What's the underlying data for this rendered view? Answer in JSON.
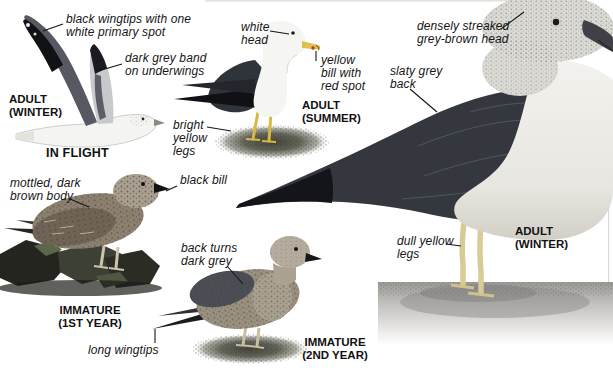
{
  "plate": {
    "subject": "gull identification plate",
    "figures": {
      "in_flight": {
        "stage": "ADULT\n(WINTER)",
        "caption": "IN FLIGHT",
        "annotations": {
          "wingtips": "black wingtips with one\nwhite primary spot",
          "underwings": "dark grey band\non underwings"
        }
      },
      "adult_summer": {
        "stage": "ADULT\n(SUMMER)",
        "annotations": {
          "head": "white\nhead",
          "bill": "yellow\nbill with\nred spot",
          "legs": "bright\nyellow\nlegs"
        }
      },
      "adult_winter": {
        "stage": "ADULT\n(WINTER)",
        "annotations": {
          "head": "densely streaked\ngrey-brown head",
          "back": "slaty grey\nback",
          "legs": "dull yellow\nlegs"
        }
      },
      "immature_first_year": {
        "stage": "IMMATURE\n(1ST YEAR)",
        "annotations": {
          "body": "mottled, dark\nbrown body",
          "bill": "black bill"
        }
      },
      "immature_second_year": {
        "stage": "IMMATURE\n(2ND YEAR)",
        "annotations": {
          "back": "back turns\ndark grey",
          "wingtips": "long wingtips"
        }
      }
    },
    "colors": {
      "label_text": "#161616",
      "slaty_grey_back": "#34373e",
      "black_wingtip": "#121316",
      "underwing_grey": "#c7c9cd",
      "underwing_band": "#5c5e66",
      "bright_yellow_legs": "#d9b945",
      "dull_yellow_legs": "#d8cc96",
      "bill_yellow": "#dfc04a",
      "bill_red_spot": "#bf3527",
      "immature_brown": "#8d8171",
      "ground_grey": "#9a9895"
    }
  }
}
